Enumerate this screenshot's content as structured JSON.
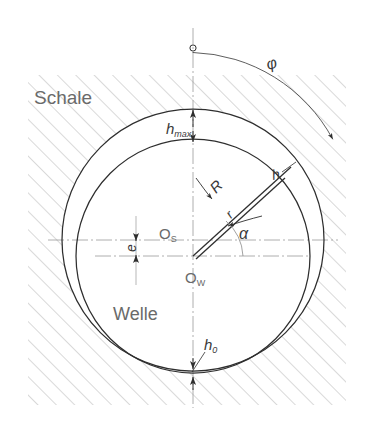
{
  "figure": {
    "type": "technical-drawing",
    "background_color": "#ffffff",
    "line_color": "#3a3a3a",
    "hatch_color": "#b9b9b9",
    "centerline_color": "#9a9a9a"
  },
  "labels": {
    "shell": "Schale",
    "shaft": "Welle",
    "h_max_base": "h",
    "h_max_sub": "max",
    "h_zero_base": "h",
    "h_zero_sub": "0",
    "h_gap": "h",
    "radius_outer": "R",
    "radius_inner": "r",
    "eccentricity": "e",
    "angle_alpha": "α",
    "angle_phi": "φ",
    "center_shell_base": "O",
    "center_shell_sub": "S",
    "center_shaft_base": "O",
    "center_shaft_sub": "W"
  },
  "geometry": {
    "shell_center": {
      "x": 193,
      "y": 240
    },
    "shaft_center": {
      "x": 193,
      "y": 256
    },
    "shell_radius": 131,
    "shaft_radius": 117,
    "eccentricity_px": 16,
    "alpha_degrees": 48,
    "phi_degrees": 58,
    "vertical_axis_x": 193,
    "shell_axis_y": 240,
    "shaft_axis_y": 256
  }
}
